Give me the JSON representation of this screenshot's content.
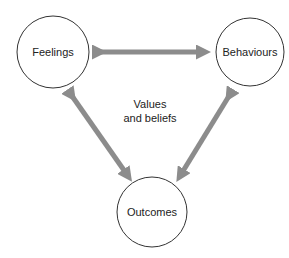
{
  "diagram": {
    "nodes": [
      {
        "id": "feelings",
        "label": "Feelings"
      },
      {
        "id": "behaviours",
        "label": "Behaviours"
      },
      {
        "id": "outcomes",
        "label": "Outcomes"
      }
    ],
    "center": {
      "line1": "Values",
      "line2": "and beliefs"
    },
    "edges": [
      {
        "from": "feelings",
        "to": "behaviours",
        "type": "bidirectional"
      },
      {
        "from": "feelings",
        "to": "outcomes",
        "type": "bidirectional"
      },
      {
        "from": "behaviours",
        "to": "outcomes",
        "type": "bidirectional"
      }
    ],
    "colors": {
      "arrow": "#8c8c8c",
      "circle": "#333333",
      "text": "#222222"
    }
  }
}
